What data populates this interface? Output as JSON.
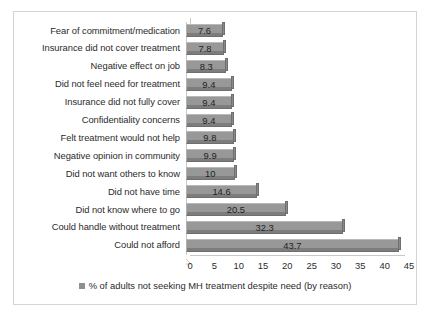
{
  "chart_data": {
    "type": "bar",
    "orientation": "horizontal",
    "title": "",
    "subtitle": "",
    "xlabel": "",
    "ylabel": "",
    "xlim": [
      0,
      45
    ],
    "xticks": [
      "0",
      "5",
      "10",
      "15",
      "20",
      "25",
      "30",
      "35",
      "40",
      "45"
    ],
    "grid": false,
    "legend_position": "bottom",
    "legend": [
      "% of adults not seeking MH treatment despite need (by reason)"
    ],
    "categories": [
      "Fear of commitment/medication",
      "Insurance did not cover treatment",
      "Negative effect on job",
      "Did not feel need for treatment",
      "Insurance did not fully cover",
      "Confidentiality concerns",
      "Felt treatment would not help",
      "Negative opinion in community",
      "Did not want others to know",
      "Did not have time",
      "Did not know where to go",
      "Could handle without treatment",
      "Could not afford"
    ],
    "values": [
      7.6,
      7.8,
      8.3,
      9.4,
      9.4,
      9.4,
      9.8,
      9.9,
      10,
      14.6,
      20.5,
      32.3,
      43.7
    ],
    "data_labels": [
      "7.6",
      "7.8",
      "8.3",
      "9.4",
      "9.4",
      "9.4",
      "9.8",
      "9.9",
      "10",
      "14.6",
      "20.5",
      "32.3",
      "43.7"
    ],
    "series": [
      {
        "name": "% of adults not seeking MH treatment despite need (by reason)",
        "values": [
          7.6,
          7.8,
          8.3,
          9.4,
          9.4,
          9.4,
          9.8,
          9.9,
          10,
          14.6,
          20.5,
          32.3,
          43.7
        ]
      }
    ]
  },
  "colors": {
    "bar_fill": "#989898",
    "bar_edge": "#6f6f6f",
    "bar_shadow": "#7d7d7d",
    "axis": "#c9c9c9",
    "frame": "#d4d4d4",
    "text": "#2b2b2b",
    "background": "#ffffff"
  }
}
